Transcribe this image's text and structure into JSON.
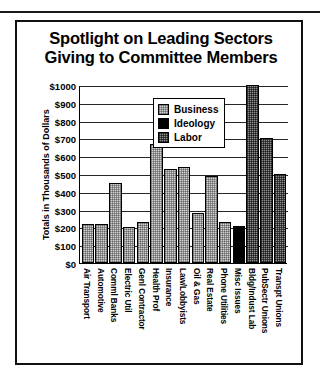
{
  "figure": {
    "title_line1": "Spotlight on Leading Sectors",
    "title_line2": "Giving to Committee Members"
  },
  "legend": {
    "items": [
      {
        "label": "Business",
        "swatch": "business-light-gray-checkered",
        "color": "#d2d2d2"
      },
      {
        "label": "Ideology",
        "swatch": "ideology-solid-black",
        "color": "#000000"
      },
      {
        "label": "Labor",
        "swatch": "labor-dark-gray-checkered",
        "color": "#8f8f8f"
      }
    ]
  },
  "chart_data": {
    "type": "bar",
    "title": "Spotlight on Leading Sectors Giving to Committee Members",
    "xlabel": "",
    "ylabel": "Totals in Thousands of Dollars",
    "ylim": [
      0,
      1000
    ],
    "ytick_labels": [
      "$1000",
      "$900",
      "$800",
      "$700",
      "$600",
      "$500",
      "$400",
      "$300",
      "$200",
      "$100",
      "$0"
    ],
    "ytick_values": [
      1000,
      900,
      800,
      700,
      600,
      500,
      400,
      300,
      200,
      100,
      0
    ],
    "grid": true,
    "legend_position": "upper-center",
    "categories": [
      "Air Transport",
      "Automotive",
      "Comml Banks",
      "Electric Util",
      "Genl Contractor",
      "Health Prof",
      "Insurance",
      "Law/Lobbyists",
      "Oil & Gas",
      "Real Estate",
      "Phone Utilities",
      "Misc Issues",
      "Bldg/Indust Lab",
      "PubSectr Unions",
      "Transpt Unions"
    ],
    "values": [
      220,
      220,
      450,
      200,
      230,
      670,
      530,
      540,
      280,
      490,
      230,
      210,
      1000,
      700,
      500
    ],
    "groups": [
      "Business",
      "Business",
      "Business",
      "Business",
      "Business",
      "Business",
      "Business",
      "Business",
      "Business",
      "Business",
      "Business",
      "Ideology",
      "Labor",
      "Labor",
      "Labor"
    ]
  }
}
